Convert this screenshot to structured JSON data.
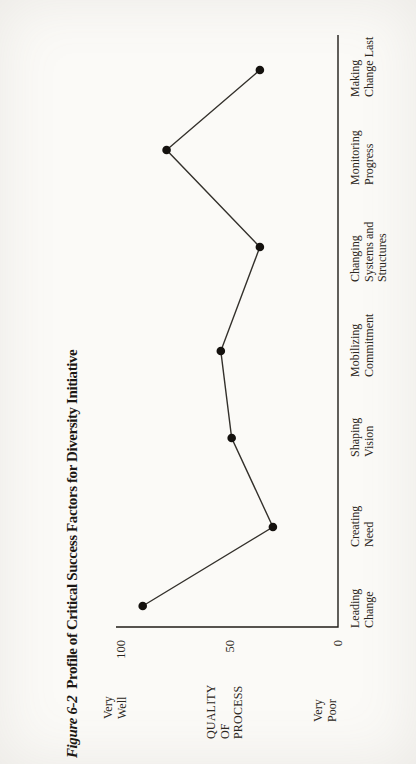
{
  "chart_data": {
    "type": "line",
    "title_prefix": "Figure 6-2",
    "title_rest": "Profile of Critical Success Factors for Diversity Initiative",
    "categories": [
      [
        "Leading",
        "Change"
      ],
      [
        "Creating",
        "Need"
      ],
      [
        "Shaping",
        "Vision"
      ],
      [
        "Mobilizing",
        "Commitment"
      ],
      [
        "Changing",
        "Systems and",
        "Structures"
      ],
      [
        "Monitoring",
        "Progress"
      ],
      [
        "Making",
        "Change Last"
      ]
    ],
    "values": [
      90,
      30,
      49,
      54,
      36,
      79,
      36
    ],
    "ylabel": "QUALITY\nOF\nPROCESS",
    "y_axis_top_label": "Very\nWell",
    "y_axis_bottom_label": "Very\nPoor",
    "yticks": [
      {
        "value": 100,
        "label": "100"
      },
      {
        "value": 50,
        "label": "50"
      },
      {
        "value": 0,
        "label": "0"
      }
    ],
    "ylim": [
      0,
      102
    ],
    "xlabel": "",
    "layout": {
      "grid": false,
      "legend": "none",
      "page_rotation": "figure rotated 90deg counter-clockwise on portrait page",
      "markers": "filled circles on single black line"
    },
    "colors": {
      "axis": "#201d19",
      "line": "#33302b",
      "point": "#14110e",
      "paper": "#fbfaf7",
      "text": "#2b2620"
    }
  }
}
